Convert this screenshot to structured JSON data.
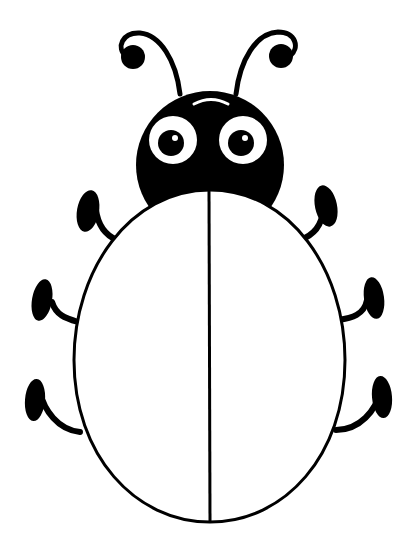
{
  "illustration": {
    "subject": "cartoon ladybug outline",
    "colors": {
      "ink": "#000000",
      "fill": "#ffffff",
      "background": "#ffffff"
    },
    "parts": [
      "antennae",
      "head",
      "eyes",
      "body-shell",
      "center-line",
      "legs"
    ],
    "leg_count": 6,
    "eye_count": 2
  }
}
